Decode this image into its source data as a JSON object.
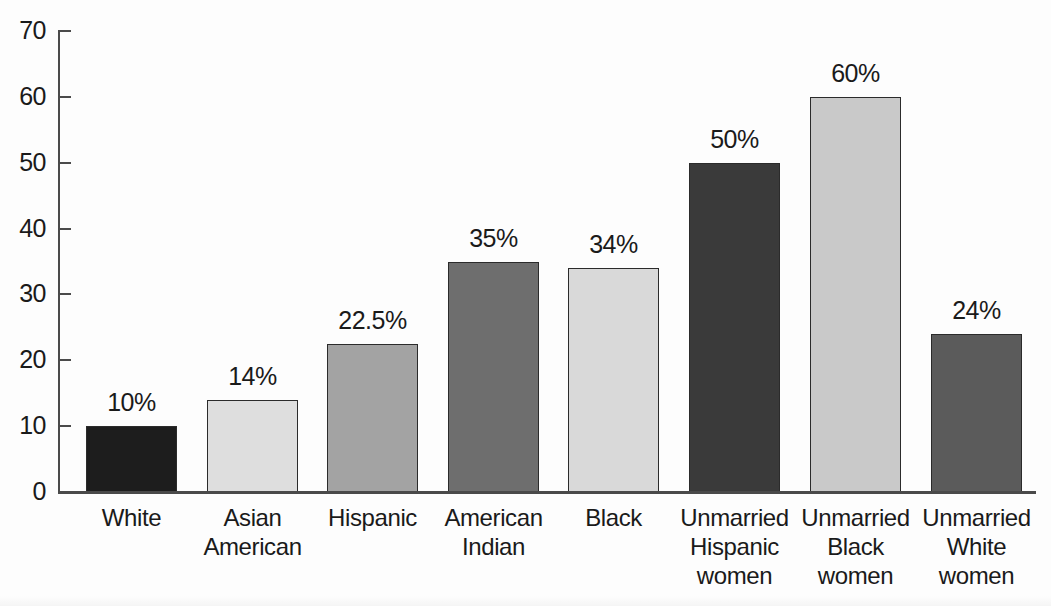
{
  "chart_data": {
    "type": "bar",
    "title": "",
    "subtitle": "",
    "xlabel": "",
    "ylabel": "",
    "ylim": [
      0,
      70
    ],
    "ytick_step": 10,
    "yticks": [
      70,
      60,
      50,
      40,
      30,
      20,
      10,
      0
    ],
    "grid": false,
    "legend": "none",
    "categories": [
      "White",
      "Asian American",
      "Hispanic",
      "American Indian",
      "Black",
      "Unmarried Hispanic women",
      "Unmarried Black women",
      "Unmarried White women"
    ],
    "category_lines": [
      [
        "White"
      ],
      [
        "Asian",
        "American"
      ],
      [
        "Hispanic"
      ],
      [
        "American",
        "Indian"
      ],
      [
        "Black"
      ],
      [
        "Unmarried",
        "Hispanic",
        "women"
      ],
      [
        "Unmarried",
        "Black",
        "women"
      ],
      [
        "Unmarried",
        "White",
        "women"
      ]
    ],
    "values": [
      10,
      14,
      22.5,
      35,
      34,
      50,
      60,
      24
    ],
    "data_labels": [
      "10%",
      "14%",
      "22.5%",
      "35%",
      "34%",
      "50%",
      "60%",
      "24%"
    ],
    "bar_colors": [
      "#1d1d1d",
      "#dedede",
      "#a3a3a3",
      "#6e6e6e",
      "#d9d9d9",
      "#3a3a3a",
      "#c9c9c9",
      "#5b5b5b"
    ],
    "bar_border_color": "#2b2b2b",
    "axis_color": "#4a4a4a",
    "background_color": "#fdfdfd",
    "text_color": "#1a1a1a"
  },
  "layout": {
    "bar_left_positions": [
      86,
      207,
      327,
      448,
      568,
      689,
      810,
      931
    ],
    "bar_width": 91,
    "plot_left": 58,
    "plot_right": 1036,
    "baseline_y": 492,
    "top_y": 31
  }
}
